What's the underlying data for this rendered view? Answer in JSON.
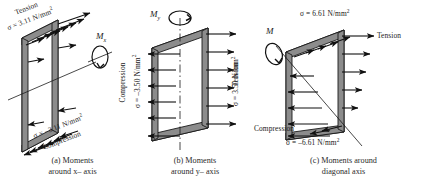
{
  "figure": {
    "type": "engineering-stress-diagram",
    "background": "#ffffff",
    "plate_fill": "#ffffff",
    "edge_fill": "#8c8c8c",
    "stroke": "#1a1a1a",
    "panels": [
      {
        "id": "a",
        "caption_line1": "(a) Moments",
        "caption_line2": "around x– axis",
        "moment_symbol": "M",
        "moment_subscript": "x",
        "neutral_axis": "horizontal diagonal through mid-height",
        "labels": {
          "top_zone": "Tension",
          "top_stress_prefix": "σ = 3.11 N/mm",
          "top_stress_exp": "2",
          "bottom_stress_prefix": "σ = –3.11 N/mm",
          "bottom_stress_exp": "2",
          "bottom_zone": "Compression"
        },
        "stress_top": 3.11,
        "stress_bottom": -3.11,
        "units": "N/mm²"
      },
      {
        "id": "b",
        "caption_line1": "(b) Moments",
        "caption_line2": "around y– axis",
        "moment_symbol": "M",
        "moment_subscript": "y",
        "neutral_axis": "vertical dash-dot centreline",
        "labels": {
          "left_zone": "Compression",
          "left_stress_prefix": "σ = –3.50 N/mm",
          "left_stress_exp": "2",
          "right_stress_prefix": "σ = 3.50 N/mm",
          "right_stress_exp": "2",
          "right_zone": "Tension"
        },
        "stress_left": -3.5,
        "stress_right": 3.5,
        "units": "N/mm²"
      },
      {
        "id": "c",
        "caption_line1": "(c) Moments around",
        "caption_line2": "diagonal axis",
        "moment_symbol": "M",
        "moment_subscript": "",
        "neutral_axis": "diagonal from upper-left to lower-right corner",
        "labels": {
          "top_stress_prefix": "σ = 6.61 N/mm",
          "top_stress_exp": "2",
          "right_zone": "Tension",
          "bottom_zone": "Compression",
          "bottom_stress_prefix": "σ = –6.61 N/mm",
          "bottom_stress_exp": "2"
        },
        "stress_top": 6.61,
        "stress_bottom": -6.61,
        "units": "N/mm²"
      }
    ]
  }
}
